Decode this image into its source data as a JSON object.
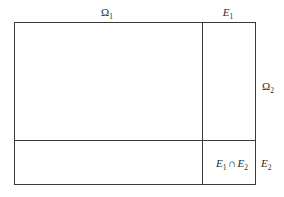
{
  "figure": {
    "type": "set-diagram",
    "colors": {
      "background": "#ffffff",
      "line": "#3a3a3a",
      "text": "#2b2b2b"
    },
    "labels": {
      "omega1": {
        "base": "Ω",
        "sub": "1"
      },
      "omega2": {
        "base": "Ω",
        "sub": "2"
      },
      "e1": {
        "base": "E",
        "sub": "1"
      },
      "e2": {
        "base": "E",
        "sub": "2"
      },
      "intersection": {
        "left_base": "E",
        "left_sub": "1",
        "operator": "∩",
        "right_base": "E",
        "right_sub": "2"
      }
    },
    "geometry": {
      "frame": {
        "x": 14,
        "y": 22,
        "width": 242,
        "height": 163
      },
      "vertical_divider_x": 202,
      "horizontal_divider_y": 140
    }
  }
}
